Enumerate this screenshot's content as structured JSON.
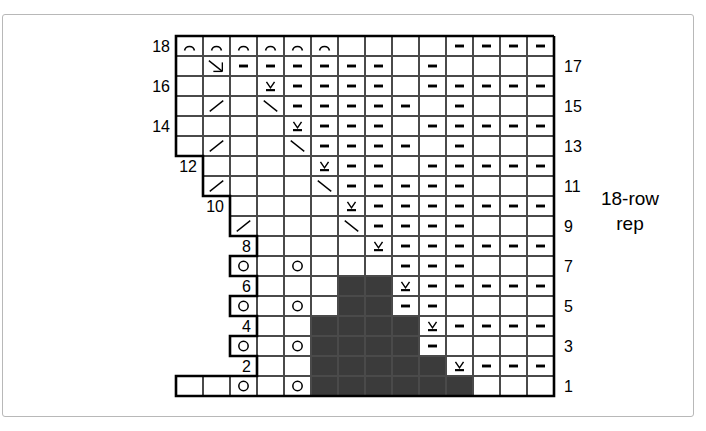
{
  "figure": {
    "kind": "knitting-stitch-chart",
    "rep_label_line1": "18-row",
    "rep_label_line2": "rep",
    "columns": 14,
    "rows": 18,
    "colors": {
      "grid_line": "#4a4a4a",
      "dark_cell": "#3b3b3b",
      "outline": "#000000",
      "frame": "#b8b8b8",
      "background": "#ffffff"
    }
  },
  "row_numbers": {
    "left": [
      {
        "label": "18",
        "row": 18
      },
      {
        "label": "16",
        "row": 16
      },
      {
        "label": "14",
        "row": 14
      },
      {
        "label": "12",
        "row": 12
      },
      {
        "label": "10",
        "row": 10
      },
      {
        "label": "8",
        "row": 8
      },
      {
        "label": "6",
        "row": 6
      },
      {
        "label": "4",
        "row": 4
      },
      {
        "label": "2",
        "row": 2
      }
    ],
    "right": [
      {
        "label": "17",
        "row": 17
      },
      {
        "label": "15",
        "row": 15
      },
      {
        "label": "13",
        "row": 13
      },
      {
        "label": "11",
        "row": 11
      },
      {
        "label": "9",
        "row": 9
      },
      {
        "label": "7",
        "row": 7
      },
      {
        "label": "5",
        "row": 5
      },
      {
        "label": "3",
        "row": 3
      },
      {
        "label": "1",
        "row": 1
      }
    ]
  },
  "legend_symbols": {
    "arc": "arc-symbol",
    "dash": "purl-dash-symbol",
    "circle": "yarn-over-circle-symbol",
    "vee": "slip-stitch-vee-symbol",
    "diag_right": "diagonal-right-symbol",
    "diag_left": "diagonal-left-symbol",
    "arrow": "decrease-arrow-symbol",
    "dark": "no-stitch-dark-symbol",
    "blank": "knit-blank-symbol"
  },
  "chart_data": {
    "type": "heatmap",
    "title": "18-row rep",
    "xlabel": "",
    "ylabel": "",
    "columns": 14,
    "rows": 18,
    "legend_position": "right",
    "grid": true,
    "cell_codes": {
      "0": "outside-chart",
      "b": "blank",
      "d": "dash",
      "o": "circle",
      "v": "vee",
      "a": "arc",
      "r": "diag-right",
      "l": "diag-left",
      "w": "arrow",
      "x": "dark"
    },
    "rows_top_to_bottom": [
      {
        "row": 18,
        "cells": [
          "a",
          "a",
          "a",
          "a",
          "a",
          "a",
          "b",
          "b",
          "b",
          "b",
          "d",
          "d",
          "d",
          "d"
        ]
      },
      {
        "row": 17,
        "cells": [
          "b",
          "w",
          "d",
          "d",
          "d",
          "d",
          "d",
          "d",
          "b",
          "d",
          "b",
          "b",
          "b",
          "b"
        ]
      },
      {
        "row": 16,
        "cells": [
          "b",
          "b",
          "b",
          "v",
          "d",
          "d",
          "d",
          "d",
          "b",
          "d",
          "d",
          "d",
          "d",
          "d"
        ]
      },
      {
        "row": 15,
        "cells": [
          "b",
          "r",
          "b",
          "l",
          "d",
          "d",
          "d",
          "d",
          "d",
          "b",
          "d",
          "b",
          "b",
          "b"
        ]
      },
      {
        "row": 14,
        "cells": [
          "b",
          "b",
          "b",
          "b",
          "v",
          "d",
          "d",
          "d",
          "b",
          "d",
          "d",
          "d",
          "d",
          "d"
        ]
      },
      {
        "row": 13,
        "cells": [
          "b",
          "r",
          "b",
          "b",
          "l",
          "d",
          "d",
          "d",
          "d",
          "b",
          "d",
          "b",
          "b",
          "b"
        ]
      },
      {
        "row": 12,
        "cells": [
          "0",
          "b",
          "b",
          "b",
          "b",
          "v",
          "d",
          "d",
          "b",
          "d",
          "d",
          "d",
          "d",
          "d"
        ]
      },
      {
        "row": 11,
        "cells": [
          "0",
          "r",
          "b",
          "b",
          "b",
          "l",
          "d",
          "d",
          "d",
          "d",
          "d",
          "b",
          "b",
          "b"
        ]
      },
      {
        "row": 10,
        "cells": [
          "0",
          "0",
          "b",
          "b",
          "b",
          "b",
          "v",
          "d",
          "d",
          "d",
          "d",
          "d",
          "d",
          "d"
        ]
      },
      {
        "row": 9,
        "cells": [
          "0",
          "0",
          "r",
          "b",
          "b",
          "b",
          "l",
          "d",
          "d",
          "d",
          "d",
          "b",
          "b",
          "b"
        ]
      },
      {
        "row": 8,
        "cells": [
          "0",
          "0",
          "0",
          "b",
          "b",
          "b",
          "b",
          "v",
          "d",
          "d",
          "d",
          "d",
          "d",
          "d"
        ]
      },
      {
        "row": 7,
        "cells": [
          "0",
          "0",
          "o",
          "b",
          "o",
          "b",
          "b",
          "b",
          "d",
          "d",
          "d",
          "b",
          "b",
          "b"
        ]
      },
      {
        "row": 6,
        "cells": [
          "0",
          "0",
          "0",
          "b",
          "b",
          "b",
          "x",
          "x",
          "v",
          "d",
          "d",
          "d",
          "d",
          "d"
        ]
      },
      {
        "row": 5,
        "cells": [
          "0",
          "0",
          "o",
          "b",
          "o",
          "b",
          "x",
          "x",
          "d",
          "d",
          "b",
          "b",
          "b",
          "b"
        ]
      },
      {
        "row": 4,
        "cells": [
          "0",
          "0",
          "0",
          "b",
          "b",
          "x",
          "x",
          "x",
          "x",
          "v",
          "d",
          "d",
          "d",
          "d"
        ]
      },
      {
        "row": 3,
        "cells": [
          "0",
          "0",
          "o",
          "b",
          "o",
          "x",
          "x",
          "x",
          "x",
          "d",
          "b",
          "b",
          "b",
          "b"
        ]
      },
      {
        "row": 2,
        "cells": [
          "0",
          "0",
          "0",
          "b",
          "b",
          "x",
          "x",
          "x",
          "x",
          "x",
          "v",
          "d",
          "d",
          "d"
        ]
      },
      {
        "row": 1,
        "cells": [
          "b",
          "b",
          "o",
          "b",
          "o",
          "x",
          "x",
          "x",
          "x",
          "x",
          "x",
          "b",
          "b",
          "b"
        ]
      }
    ]
  }
}
